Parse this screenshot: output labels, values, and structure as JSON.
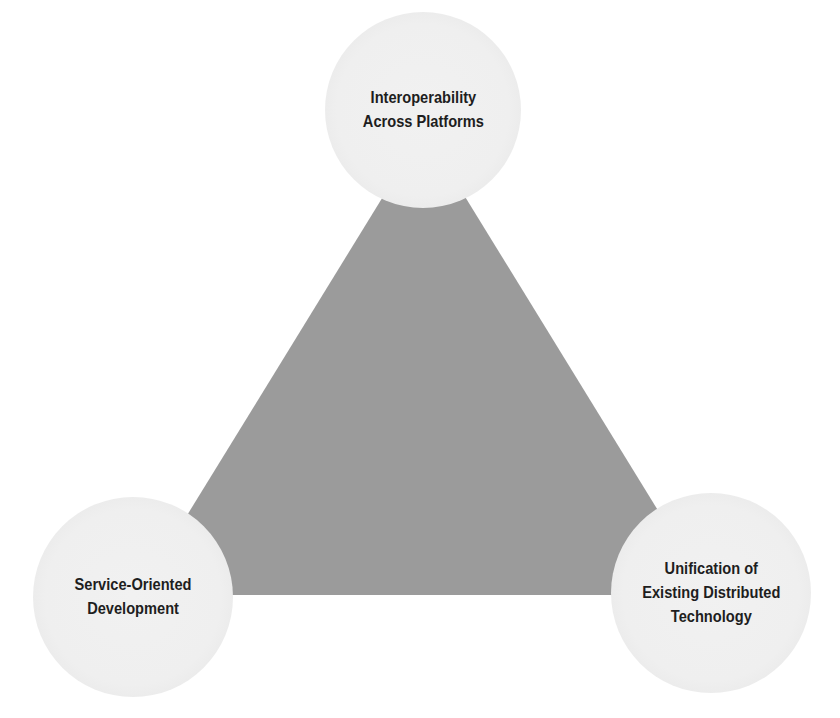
{
  "diagram": {
    "type": "triangle-with-vertex-circles",
    "colors": {
      "background": "#ffffff",
      "triangle_fill": "#9b9b9b",
      "circle_fill": "#f0f0f0",
      "text": "#1e1e1e"
    },
    "nodes": [
      {
        "id": "top",
        "lines": [
          "Interoperability",
          "Across Platforms"
        ]
      },
      {
        "id": "bottom-left",
        "lines": [
          "Service-Oriented",
          "Development"
        ]
      },
      {
        "id": "bottom-right",
        "lines": [
          "Unification of",
          "Existing Distributed",
          "Technology"
        ]
      }
    ]
  }
}
